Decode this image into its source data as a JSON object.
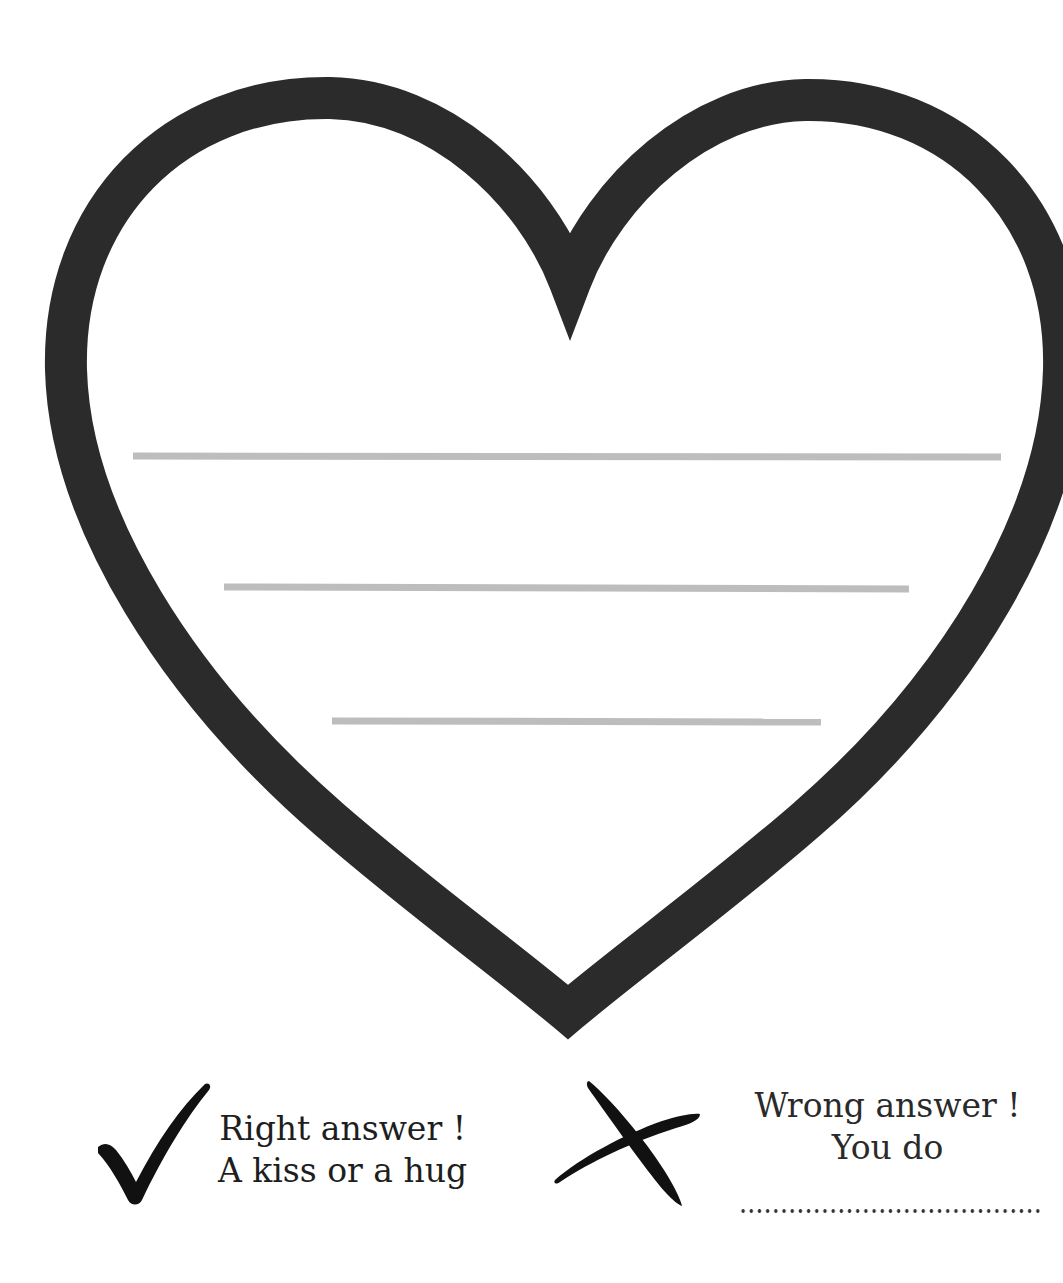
{
  "worksheet": {
    "heart": {
      "shape": "heart-outline",
      "outline_color": "#2b2b2b",
      "writing_lines": [
        {
          "x1": 133,
          "x2": 1001,
          "y": 456
        },
        {
          "x1": 224,
          "x2": 909,
          "y": 587
        },
        {
          "x1": 332,
          "x2": 821,
          "y": 721
        }
      ],
      "line_color": "#bdbdbd"
    },
    "legend": {
      "right": {
        "icon": "check-mark-icon",
        "line1": "Right answer !",
        "line2": "A kiss or a hug"
      },
      "wrong": {
        "icon": "x-mark-icon",
        "line1": "Wrong answer !",
        "line2": "You do",
        "blank": "fill-in-dotted-line"
      }
    }
  }
}
